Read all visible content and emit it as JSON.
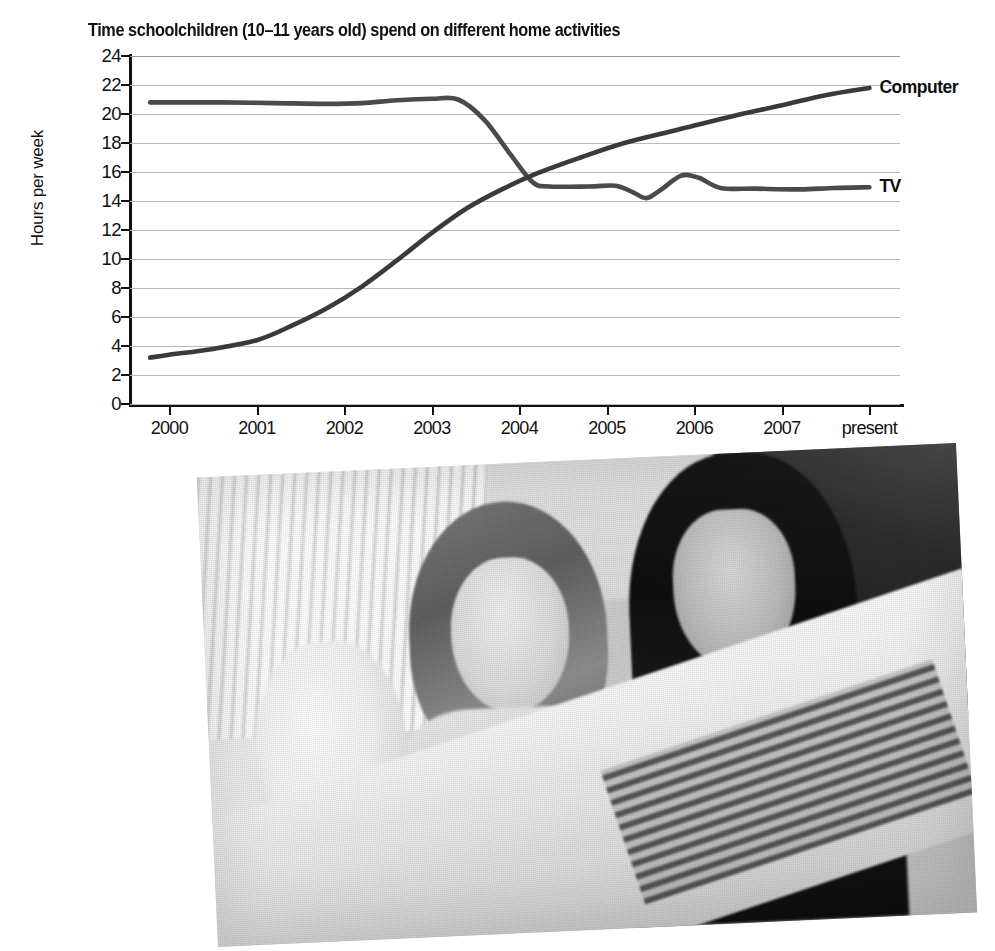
{
  "figure": {
    "caption_photo_alt": "Two schoolgirls smiling while looking at a computer monitor"
  },
  "chart_data": {
    "type": "line",
    "title": "Time schoolchildren (10–11 years old) spend on different home activities",
    "xlabel": "",
    "ylabel": "Hours per week",
    "ylim": [
      0,
      24
    ],
    "ytick_step": 2,
    "yticks": [
      "24",
      "22",
      "20",
      "18",
      "16",
      "14",
      "12",
      "10",
      "8",
      "6",
      "4",
      "2",
      "0"
    ],
    "categories": [
      "2000",
      "2001",
      "2002",
      "2003",
      "2004",
      "2005",
      "2006",
      "2007",
      "present"
    ],
    "grid": true,
    "legend_position": "right-inline",
    "series": [
      {
        "name": "TV",
        "color": "#4a4a4a",
        "label": "TV",
        "values": [
          20.8,
          20.8,
          20.7,
          21.0,
          15.1,
          15.0,
          15.0,
          14.9,
          14.9
        ],
        "points": [
          {
            "x": 1999.78,
            "y": 20.8
          },
          {
            "x": 2000.0,
            "y": 20.8
          },
          {
            "x": 2000.6,
            "y": 20.8
          },
          {
            "x": 2001.2,
            "y": 20.75
          },
          {
            "x": 2001.8,
            "y": 20.7
          },
          {
            "x": 2002.2,
            "y": 20.75
          },
          {
            "x": 2002.6,
            "y": 20.95
          },
          {
            "x": 2003.0,
            "y": 21.05
          },
          {
            "x": 2003.3,
            "y": 21.0
          },
          {
            "x": 2003.6,
            "y": 19.6
          },
          {
            "x": 2003.9,
            "y": 17.2
          },
          {
            "x": 2004.15,
            "y": 15.3
          },
          {
            "x": 2004.35,
            "y": 15.0
          },
          {
            "x": 2004.8,
            "y": 15.0
          },
          {
            "x": 2005.1,
            "y": 15.05
          },
          {
            "x": 2005.3,
            "y": 14.6
          },
          {
            "x": 2005.45,
            "y": 14.2
          },
          {
            "x": 2005.6,
            "y": 14.7
          },
          {
            "x": 2005.85,
            "y": 15.75
          },
          {
            "x": 2006.05,
            "y": 15.6
          },
          {
            "x": 2006.3,
            "y": 14.9
          },
          {
            "x": 2006.7,
            "y": 14.85
          },
          {
            "x": 2007.2,
            "y": 14.8
          },
          {
            "x": 2007.6,
            "y": 14.9
          },
          {
            "x": 2008.0,
            "y": 14.95
          }
        ]
      },
      {
        "name": "Computer",
        "color": "#3a3a3a",
        "label": "Computer",
        "values": [
          3.2,
          4.3,
          6.8,
          13.6,
          16.0,
          18.2,
          19.8,
          21.0,
          21.8
        ],
        "points": [
          {
            "x": 1999.78,
            "y": 3.2
          },
          {
            "x": 2000.0,
            "y": 3.4
          },
          {
            "x": 2000.5,
            "y": 3.8
          },
          {
            "x": 2001.0,
            "y": 4.4
          },
          {
            "x": 2001.4,
            "y": 5.4
          },
          {
            "x": 2001.8,
            "y": 6.6
          },
          {
            "x": 2002.2,
            "y": 8.1
          },
          {
            "x": 2002.6,
            "y": 9.9
          },
          {
            "x": 2003.0,
            "y": 11.8
          },
          {
            "x": 2003.4,
            "y": 13.5
          },
          {
            "x": 2003.8,
            "y": 14.8
          },
          {
            "x": 2004.2,
            "y": 15.9
          },
          {
            "x": 2004.7,
            "y": 17.0
          },
          {
            "x": 2005.2,
            "y": 18.0
          },
          {
            "x": 2005.8,
            "y": 18.9
          },
          {
            "x": 2006.4,
            "y": 19.8
          },
          {
            "x": 2007.0,
            "y": 20.6
          },
          {
            "x": 2007.5,
            "y": 21.3
          },
          {
            "x": 2008.0,
            "y": 21.8
          }
        ]
      }
    ]
  }
}
